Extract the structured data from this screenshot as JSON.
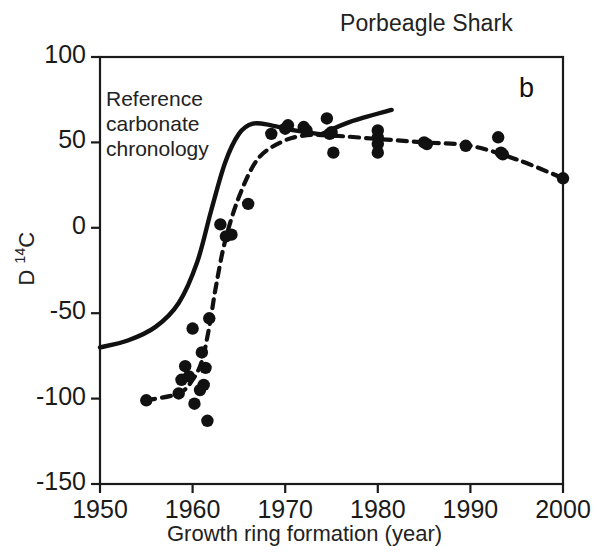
{
  "chart_data": {
    "type": "scatter",
    "title": "Porbeagle Shark",
    "panel_label": "b",
    "xlabel": "Growth ring formation (year)",
    "ylabel": "D 14C",
    "ylabel_prefix": "D ",
    "ylabel_sup": "14",
    "ylabel_suffix": "C",
    "xlim": [
      1950,
      2000
    ],
    "ylim": [
      -150,
      100
    ],
    "xticks": [
      1950,
      1960,
      1970,
      1980,
      1990,
      2000
    ],
    "xtick_labels": [
      "1950",
      "1960",
      "1970",
      "1980",
      "1990",
      "2000"
    ],
    "yticks": [
      100,
      50,
      0,
      -50,
      -100,
      -150
    ],
    "ytick_labels": [
      "100",
      "50",
      "0",
      "-50",
      "-100",
      "-150"
    ],
    "grid": false,
    "legend": "none",
    "annotations": [
      {
        "name": "reference-carbonate-chronology-label",
        "text": "Reference\ncarbonate\nchronology",
        "line1": "Reference",
        "line2": "carbonate",
        "line3": "chronology"
      }
    ],
    "series": [
      {
        "name": "Porbeagle shark vertebral samples",
        "style": "filled-circle-markers",
        "marker_color": "#111111",
        "points": [
          {
            "x": 1955.0,
            "y": -101
          },
          {
            "x": 1958.5,
            "y": -97
          },
          {
            "x": 1958.8,
            "y": -89
          },
          {
            "x": 1959.2,
            "y": -81
          },
          {
            "x": 1959.6,
            "y": -87
          },
          {
            "x": 1960.0,
            "y": -59
          },
          {
            "x": 1960.2,
            "y": -103
          },
          {
            "x": 1960.8,
            "y": -95
          },
          {
            "x": 1961.0,
            "y": -73
          },
          {
            "x": 1961.2,
            "y": -92
          },
          {
            "x": 1961.4,
            "y": -82
          },
          {
            "x": 1961.6,
            "y": -113
          },
          {
            "x": 1961.8,
            "y": -53
          },
          {
            "x": 1963.0,
            "y": 2
          },
          {
            "x": 1963.6,
            "y": -5
          },
          {
            "x": 1964.2,
            "y": -4
          },
          {
            "x": 1966.0,
            "y": 14
          },
          {
            "x": 1968.5,
            "y": 55
          },
          {
            "x": 1970.0,
            "y": 58
          },
          {
            "x": 1970.3,
            "y": 60
          },
          {
            "x": 1972.0,
            "y": 59
          },
          {
            "x": 1972.3,
            "y": 57
          },
          {
            "x": 1974.5,
            "y": 64
          },
          {
            "x": 1974.8,
            "y": 55
          },
          {
            "x": 1975.0,
            "y": 56
          },
          {
            "x": 1975.2,
            "y": 44
          },
          {
            "x": 1980.0,
            "y": 57
          },
          {
            "x": 1980.0,
            "y": 53
          },
          {
            "x": 1980.0,
            "y": 49
          },
          {
            "x": 1980.0,
            "y": 44
          },
          {
            "x": 1985.0,
            "y": 50
          },
          {
            "x": 1985.3,
            "y": 49
          },
          {
            "x": 1989.5,
            "y": 48
          },
          {
            "x": 1993.0,
            "y": 53
          },
          {
            "x": 1993.3,
            "y": 44
          },
          {
            "x": 1993.5,
            "y": 43
          },
          {
            "x": 2000.0,
            "y": 29
          }
        ]
      },
      {
        "name": "Reference carbonate chronology",
        "style": "solid-line",
        "line_color": "#111111",
        "points": [
          {
            "x": 1950.0,
            "y": -70
          },
          {
            "x": 1953.0,
            "y": -66
          },
          {
            "x": 1956.0,
            "y": -58
          },
          {
            "x": 1958.5,
            "y": -44
          },
          {
            "x": 1960.5,
            "y": -20
          },
          {
            "x": 1962.0,
            "y": 10
          },
          {
            "x": 1963.5,
            "y": 38
          },
          {
            "x": 1965.0,
            "y": 55
          },
          {
            "x": 1966.5,
            "y": 61
          },
          {
            "x": 1968.5,
            "y": 60
          },
          {
            "x": 1971.0,
            "y": 57
          },
          {
            "x": 1973.5,
            "y": 55
          },
          {
            "x": 1975.5,
            "y": 54
          }
        ]
      },
      {
        "name": "Reference chronology upper branch",
        "style": "solid-line",
        "line_color": "#111111",
        "points": [
          {
            "x": 1974.0,
            "y": 55
          },
          {
            "x": 1977.0,
            "y": 62
          },
          {
            "x": 1981.5,
            "y": 69
          }
        ]
      },
      {
        "name": "Shark age-validated fitted curve",
        "style": "dashed-line",
        "line_color": "#111111",
        "points": [
          {
            "x": 1955.0,
            "y": -101
          },
          {
            "x": 1958.5,
            "y": -97
          },
          {
            "x": 1960.0,
            "y": -89
          },
          {
            "x": 1961.0,
            "y": -78
          },
          {
            "x": 1961.8,
            "y": -58
          },
          {
            "x": 1962.5,
            "y": -35
          },
          {
            "x": 1963.5,
            "y": -8
          },
          {
            "x": 1965.0,
            "y": 18
          },
          {
            "x": 1967.0,
            "y": 40
          },
          {
            "x": 1969.5,
            "y": 50
          },
          {
            "x": 1972.0,
            "y": 54
          },
          {
            "x": 1975.0,
            "y": 54
          },
          {
            "x": 1980.0,
            "y": 52
          },
          {
            "x": 1985.0,
            "y": 50
          },
          {
            "x": 1990.0,
            "y": 48
          },
          {
            "x": 1995.0,
            "y": 40
          },
          {
            "x": 2000.0,
            "y": 29
          }
        ]
      }
    ]
  }
}
